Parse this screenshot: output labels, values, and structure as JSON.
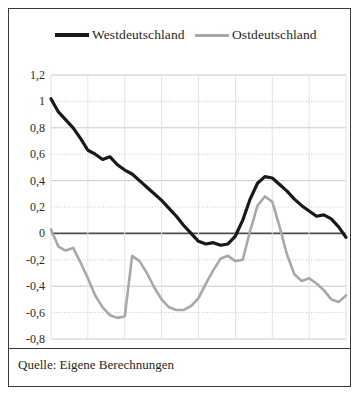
{
  "figure": {
    "source_note": "Quelle: Eigene Berechnungen"
  },
  "chart_data": {
    "type": "line",
    "title": "",
    "subtitle": "",
    "xlabel": "",
    "ylabel": "",
    "xlim": [
      2010,
      2050
    ],
    "ylim": [
      -0.8,
      1.2
    ],
    "grid": true,
    "legend_position": "top",
    "zero_line": true,
    "x_ticks": [
      "2010",
      "2015",
      "2020",
      "2025",
      "2030",
      "2035",
      "2040",
      "2045",
      "2050"
    ],
    "x_tick_values": [
      2010,
      2015,
      2020,
      2025,
      2030,
      2035,
      2040,
      2045,
      2050
    ],
    "y_ticks": [
      "1,2",
      "1",
      "0,8",
      "0,6",
      "0,4",
      "0,2",
      "0",
      "-0,2",
      "-0,4",
      "-0,6",
      "-0,8"
    ],
    "y_tick_values": [
      1.2,
      1.0,
      0.8,
      0.6,
      0.4,
      0.2,
      0.0,
      -0.2,
      -0.4,
      -0.6,
      -0.8
    ],
    "colors": {
      "west": "#181818",
      "east": "#a8a8a8",
      "grid": "#c9c9c9",
      "zero_line": "#4d4d4d",
      "border": "#3a3a3a"
    },
    "x": [
      2010,
      2011,
      2012,
      2013,
      2014,
      2015,
      2016,
      2017,
      2018,
      2019,
      2020,
      2021,
      2022,
      2023,
      2024,
      2025,
      2026,
      2027,
      2028,
      2029,
      2030,
      2031,
      2032,
      2033,
      2034,
      2035,
      2036,
      2037,
      2038,
      2039,
      2040,
      2041,
      2042,
      2043,
      2044,
      2045,
      2046,
      2047,
      2048,
      2049,
      2050
    ],
    "series": [
      {
        "name": "Westdeutschland",
        "color": "#181818",
        "width": 3.2,
        "values": [
          1.02,
          0.92,
          0.86,
          0.8,
          0.72,
          0.63,
          0.6,
          0.56,
          0.58,
          0.52,
          0.48,
          0.45,
          0.4,
          0.35,
          0.3,
          0.25,
          0.19,
          0.13,
          0.06,
          0.0,
          -0.06,
          -0.08,
          -0.07,
          -0.09,
          -0.08,
          -0.02,
          0.1,
          0.26,
          0.38,
          0.43,
          0.42,
          0.37,
          0.32,
          0.26,
          0.21,
          0.17,
          0.13,
          0.14,
          0.11,
          0.05,
          -0.03
        ]
      },
      {
        "name": "Ostdeutschland",
        "color": "#a8a8a8",
        "width": 2.6,
        "values": [
          0.03,
          -0.1,
          -0.13,
          -0.11,
          -0.22,
          -0.34,
          -0.47,
          -0.56,
          -0.62,
          -0.64,
          -0.63,
          -0.17,
          -0.21,
          -0.3,
          -0.41,
          -0.5,
          -0.56,
          -0.58,
          -0.58,
          -0.55,
          -0.49,
          -0.38,
          -0.28,
          -0.19,
          -0.17,
          -0.21,
          -0.2,
          0.02,
          0.21,
          0.28,
          0.24,
          0.05,
          -0.16,
          -0.31,
          -0.36,
          -0.34,
          -0.38,
          -0.43,
          -0.5,
          -0.52,
          -0.47
        ]
      }
    ]
  }
}
